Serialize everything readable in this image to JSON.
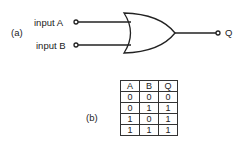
{
  "part_a": {
    "label": "(a)",
    "gate": "OR gate",
    "input_a": "input A",
    "input_b": "input B",
    "output": "Q"
  },
  "part_b": {
    "label": "(b)",
    "headers": [
      "A",
      "B",
      "Q"
    ],
    "rows": [
      [
        "0",
        "0",
        "0"
      ],
      [
        "0",
        "1",
        "1"
      ],
      [
        "1",
        "0",
        "1"
      ],
      [
        "1",
        "1",
        "1"
      ]
    ]
  }
}
